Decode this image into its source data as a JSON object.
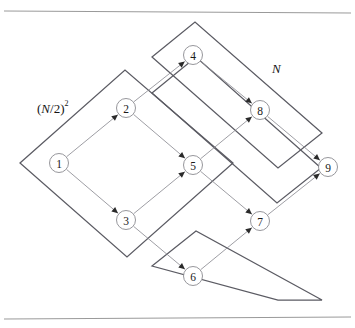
{
  "figure": {
    "background_color": "#ffffff",
    "rule_color": "#9a9a9a",
    "boundary_color": "#5b5b63",
    "edge_color": "#8d8d93",
    "node_fill": "#ffffff",
    "node_stroke": "#8a8a90",
    "arrow_color": "#2a2a2a",
    "width": 355,
    "height": 328
  },
  "rules": [
    {
      "name": "top-rule",
      "x1": 4,
      "y1": 11,
      "x2": 351,
      "y2": 13
    },
    {
      "name": "bottom-rule",
      "x1": 4,
      "y1": 319,
      "x2": 351,
      "y2": 317
    }
  ],
  "regions": [
    {
      "id": "region-small",
      "label": "(N/2)",
      "label_base": "(",
      "label_var": "N",
      "label_rest": "/2)",
      "label_exponent": "2",
      "label_x": 37,
      "label_y": 108,
      "points": "20,163 125,70 233,163 127,257"
    },
    {
      "id": "region-mid",
      "label": "",
      "points": "152,57 195,22 322,133 278,168"
    },
    {
      "id": "region-large",
      "label": "N",
      "label_var": "N",
      "label_x": 272,
      "label_y": 68,
      "points": "152,93 196,57 321,168 277,203"
    },
    {
      "id": "region-bottom",
      "label": "",
      "points": "152,266 196,231 322,300 278,300"
    }
  ],
  "nodes": [
    {
      "id": "1",
      "label": "1",
      "cx": 59,
      "cy": 163,
      "r": 9.5
    },
    {
      "id": "2",
      "label": "2",
      "cx": 126,
      "cy": 108,
      "r": 9.5
    },
    {
      "id": "3",
      "label": "3",
      "cx": 126,
      "cy": 220,
      "r": 9.5
    },
    {
      "id": "4",
      "label": "4",
      "cx": 193,
      "cy": 55,
      "r": 9.5
    },
    {
      "id": "5",
      "label": "5",
      "cx": 193,
      "cy": 165,
      "r": 9.5
    },
    {
      "id": "6",
      "label": "6",
      "cx": 193,
      "cy": 276,
      "r": 9.5
    },
    {
      "id": "7",
      "label": "7",
      "cx": 260,
      "cy": 221,
      "r": 9.5
    },
    {
      "id": "8",
      "label": "8",
      "cx": 260,
      "cy": 110,
      "r": 9.5
    },
    {
      "id": "9",
      "label": "9",
      "cx": 328,
      "cy": 167,
      "r": 9.5
    }
  ],
  "edges": [
    {
      "id": "e1-2",
      "from": "1",
      "to": "2",
      "arrow": true
    },
    {
      "id": "e1-3",
      "from": "1",
      "to": "3",
      "arrow": true
    },
    {
      "id": "e2-5",
      "from": "2",
      "to": "5",
      "arrow": true
    },
    {
      "id": "e3-5",
      "from": "3",
      "to": "5",
      "arrow": true
    },
    {
      "id": "e2-4",
      "from": "2",
      "to": "4",
      "arrow": true
    },
    {
      "id": "e3-6",
      "from": "3",
      "to": "6",
      "arrow": true
    },
    {
      "id": "e4-8",
      "from": "4",
      "to": "8",
      "arrow": true
    },
    {
      "id": "e5-8",
      "from": "5",
      "to": "8",
      "arrow": true
    },
    {
      "id": "e5-7",
      "from": "5",
      "to": "7",
      "arrow": true
    },
    {
      "id": "e6-7",
      "from": "6",
      "to": "7",
      "arrow": true
    },
    {
      "id": "e8-9",
      "from": "8",
      "to": "9",
      "arrow": true
    },
    {
      "id": "e7-9",
      "from": "7",
      "to": "9",
      "arrow": true
    }
  ]
}
